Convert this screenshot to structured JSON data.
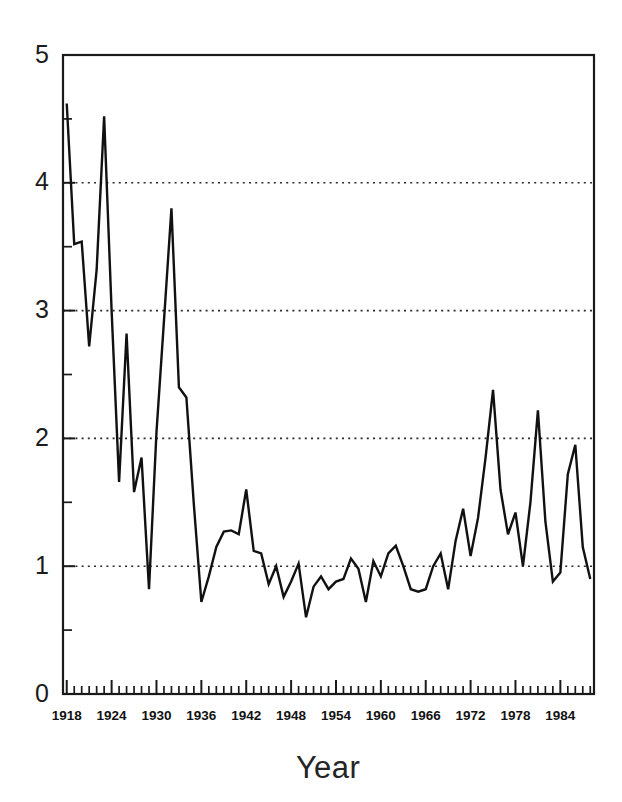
{
  "chart_data": {
    "type": "line",
    "title": "",
    "xlabel": "Year",
    "ylabel": "",
    "xlim": [
      1917.5,
      1988.5
    ],
    "ylim": [
      0,
      5
    ],
    "grid": true,
    "gridlines_y": [
      1,
      2,
      3,
      4
    ],
    "legend": "none",
    "y_ticks_major": [
      0,
      1,
      2,
      3,
      4,
      5
    ],
    "y_ticks_minor": [
      0.5,
      1.5,
      2.5,
      3.5,
      4.5
    ],
    "y_tick_labels": [
      "0",
      "1",
      "2",
      "3",
      "4",
      "5"
    ],
    "x_tick_labels": [
      "1918",
      "1924",
      "1930",
      "1936",
      "1942",
      "1948",
      "1954",
      "1960",
      "1966",
      "1972",
      "1978",
      "1984"
    ],
    "x_tick_values": [
      1918,
      1924,
      1930,
      1936,
      1942,
      1948,
      1954,
      1960,
      1966,
      1972,
      1978,
      1984
    ],
    "x_minor_tick_step": 1,
    "line_color": "#111111",
    "x": [
      1918,
      1919,
      1920,
      1921,
      1922,
      1923,
      1924,
      1925,
      1926,
      1927,
      1928,
      1929,
      1930,
      1931,
      1932,
      1933,
      1934,
      1935,
      1936,
      1937,
      1938,
      1939,
      1940,
      1941,
      1942,
      1943,
      1944,
      1945,
      1946,
      1947,
      1948,
      1949,
      1950,
      1951,
      1952,
      1953,
      1954,
      1955,
      1956,
      1957,
      1958,
      1959,
      1960,
      1961,
      1962,
      1963,
      1964,
      1965,
      1966,
      1967,
      1968,
      1969,
      1970,
      1971,
      1972,
      1973,
      1974,
      1975,
      1976,
      1977,
      1978,
      1979,
      1980,
      1981,
      1982,
      1983,
      1984,
      1985,
      1986,
      1987,
      1988
    ],
    "values": [
      4.62,
      3.52,
      3.54,
      2.72,
      3.32,
      4.52,
      3.0,
      1.66,
      2.82,
      1.58,
      1.85,
      0.82,
      2.05,
      2.92,
      3.8,
      2.4,
      2.32,
      1.48,
      0.72,
      0.92,
      1.15,
      1.27,
      1.28,
      1.25,
      1.6,
      1.12,
      1.1,
      0.86,
      1.0,
      0.76,
      0.88,
      1.02,
      0.6,
      0.84,
      0.92,
      0.82,
      0.88,
      0.9,
      1.06,
      0.98,
      0.72,
      1.04,
      0.92,
      1.1,
      1.16,
      1.0,
      0.82,
      0.8,
      0.82,
      1.0,
      1.1,
      0.82,
      1.2,
      1.45,
      1.08,
      1.38,
      1.85,
      2.38,
      1.6,
      1.25,
      1.42,
      1.0,
      1.5,
      2.22,
      1.35,
      0.88,
      0.95,
      1.72,
      1.95,
      1.15,
      0.9
    ],
    "series_name": "annual value"
  }
}
